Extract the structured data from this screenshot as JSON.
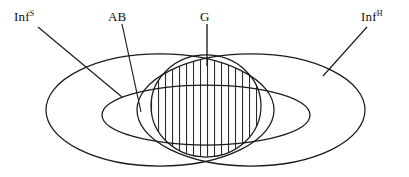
{
  "figure": {
    "type": "venn-diagram",
    "background_color": "#ffffff",
    "stroke_color": "#1a1a1a",
    "hatch_color": "#2a2a2a",
    "width": 409,
    "height": 177
  },
  "labels": {
    "inf_s": {
      "base": "Inf",
      "superscript": "S",
      "name": "soft-information-set-label"
    },
    "ab": {
      "base": "AB",
      "superscript": "",
      "name": "ab-set-label"
    },
    "g": {
      "base": "G",
      "superscript": "",
      "name": "g-set-label"
    },
    "inf_h": {
      "base": "Inf",
      "superscript": "H",
      "name": "hard-information-set-label"
    }
  },
  "regions": [
    {
      "id": "inf_s",
      "label": "Inf",
      "superscript": "S",
      "shape": "ellipse",
      "cx": 160,
      "cy": 110,
      "rx": 114,
      "ry": 56,
      "fill": "none"
    },
    {
      "id": "inf_h",
      "label": "Inf",
      "superscript": "H",
      "shape": "ellipse",
      "cx": 251,
      "cy": 110,
      "rx": 114,
      "ry": 56,
      "fill": "none"
    },
    {
      "id": "ab",
      "label": "AB",
      "superscript": "",
      "shape": "ellipse",
      "cx": 206,
      "cy": 115,
      "rx": 104,
      "ry": 30,
      "fill": "none"
    },
    {
      "id": "g",
      "label": "G",
      "superscript": "",
      "shape": "circle-lens",
      "cx": 206,
      "cy": 106,
      "rx": 55,
      "ry": 51,
      "fill": "vertical-hatch"
    }
  ],
  "hatching": {
    "orientation": "vertical",
    "line_count": 15,
    "spacing_px": 7,
    "x_start": 158,
    "x_end": 256,
    "color": "#2a2a2a"
  },
  "leader_lines": [
    {
      "from_label": "inf_s",
      "x1": 38,
      "y1": 27,
      "x2": 122,
      "y2": 97
    },
    {
      "from_label": "ab",
      "x1": 122,
      "y1": 24,
      "x2": 141,
      "y2": 112
    },
    {
      "from_label": "g",
      "x1": 207,
      "y1": 24,
      "x2": 207,
      "y2": 66
    },
    {
      "from_label": "inf_h",
      "x1": 367,
      "y1": 27,
      "x2": 323,
      "y2": 76
    }
  ]
}
